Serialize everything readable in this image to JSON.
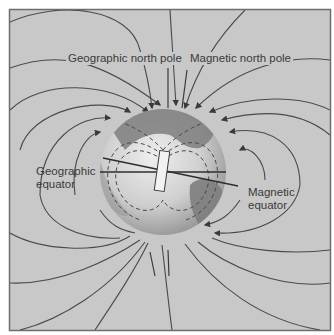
{
  "figure": {
    "type": "Earth magnetic field diagram",
    "colors": {
      "frame_background": "#c8c8c8",
      "frame_border": "#6e6e6e",
      "field_line": "#4a4a4a",
      "globe_light": "#dcdcdc",
      "globe_dark": "#8a8a8a",
      "continent": "#7e7e7e",
      "magnet_fill": "#f2f2f2",
      "label_text": "#3a3a3a"
    }
  },
  "labels": {
    "geographic_north_pole": "Geographic north pole",
    "magnetic_north_pole": "Magnetic north pole",
    "geographic_equator_line1": "Geographic",
    "geographic_equator_line2": "equator",
    "magnetic_equator_line1": "Magnetic",
    "magnetic_equator_line2": "equator"
  }
}
